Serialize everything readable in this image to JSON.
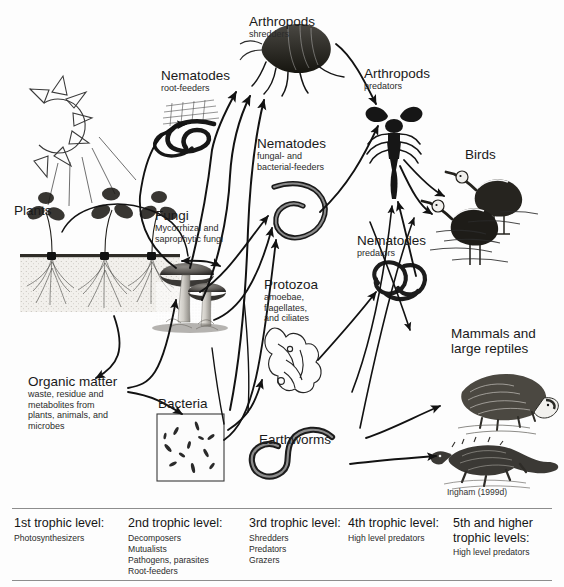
{
  "figure": {
    "credit": "Ingham (1999d)",
    "line_color": "#121212",
    "background": "#fdfdfd"
  },
  "nodes": [
    {
      "id": "sun",
      "icon": "sun-icon",
      "name": "",
      "sub": ""
    },
    {
      "id": "plants",
      "icon": "plants-icon",
      "name": "Plants",
      "sub": ""
    },
    {
      "id": "organic",
      "icon": "organic-matter-icon",
      "name": "Organic matter",
      "sub": "waste, residue and\nmetabolites from\nplants, animals, and\nmicrobes"
    },
    {
      "id": "fungi",
      "icon": "mushroom-icon",
      "name": "Fungi",
      "sub": "Mycorrhizal and\nsaprophytic fungi"
    },
    {
      "id": "bacteria",
      "icon": "bacteria-icon",
      "name": "Bacteria",
      "sub": ""
    },
    {
      "id": "nem-root",
      "icon": "nematode-coil-icon",
      "name": "Nematodes",
      "sub": "root-feeders"
    },
    {
      "id": "nem-fb",
      "icon": "nematode-worm-icon",
      "name": "Nematodes",
      "sub": "fungal- and\nbacterial-feeders"
    },
    {
      "id": "nem-pred",
      "icon": "nematode-knot-icon",
      "name": "Nematodes",
      "sub": "predators"
    },
    {
      "id": "protozoa",
      "icon": "amoeba-icon",
      "name": "Protozoa",
      "sub": "amoebae,\nflagellates,\nand ciliates"
    },
    {
      "id": "earthworms",
      "icon": "earthworm-icon",
      "name": "Earthworms",
      "sub": ""
    },
    {
      "id": "arth-shred",
      "icon": "flea-icon",
      "name": "Arthropods",
      "sub": "shredders"
    },
    {
      "id": "arth-pred",
      "icon": "scorpion-icon",
      "name": "Arthropods",
      "sub": "predators"
    },
    {
      "id": "birds",
      "icon": "birds-icon",
      "name": "Birds",
      "sub": ""
    },
    {
      "id": "mammals",
      "icon": "badger-icon",
      "name": "Mammals and\nlarge reptiles",
      "sub": ""
    },
    {
      "id": "reptile",
      "icon": "iguana-icon",
      "name": "",
      "sub": ""
    }
  ],
  "labels": {
    "arthropods_shredders": {
      "line1": "Arthropods",
      "line2": "shredders"
    },
    "arthropods_predators": {
      "line1": "Arthropods",
      "line2": "predators"
    },
    "nematodes_rootfeeders": {
      "line1": "Nematodes",
      "line2": "root-feeders"
    },
    "nematodes_fungalbact": {
      "line1": "Nematodes",
      "line2a": "fungal- and",
      "line2b": "bacterial-feeders"
    },
    "nematodes_predators": {
      "line1": "Nematodes",
      "line2": "predators"
    },
    "protozoa": {
      "line1": "Protozoa",
      "line2a": "amoebae,",
      "line2b": "flagellates,",
      "line2c": "and ciliates"
    },
    "fungi": {
      "line1": "Fungi",
      "line2a": "Mycorrhizal and",
      "line2b": "saprophytic fungi"
    },
    "plants": {
      "line1": "Plants"
    },
    "organic_matter": {
      "line1": "Organic matter",
      "line2a": "waste, residue and",
      "line2b": "metabolites from",
      "line2c": "plants, animals, and",
      "line2d": "microbes"
    },
    "bacteria": {
      "line1": "Bacteria"
    },
    "earthworms": {
      "line1": "Earthworms"
    },
    "birds": {
      "line1": "Birds"
    },
    "mammals": {
      "line1a": "Mammals and",
      "line1b": "large reptiles"
    }
  },
  "legend": {
    "columns": [
      {
        "head": "1st trophic level:",
        "items": [
          "Photosynthesizers"
        ]
      },
      {
        "head": "2nd trophic level:",
        "items": [
          "Decomposers",
          "Mutualists",
          "Pathogens, parasites",
          "Root-feeders"
        ]
      },
      {
        "head": "3rd trophic level:",
        "items": [
          "Shredders",
          "Predators",
          "Grazers"
        ]
      },
      {
        "head": "4th trophic level:",
        "items": [
          "High level predators"
        ]
      },
      {
        "head": "5th and higher",
        "head2": "trophic levels:",
        "items": [
          "High level predators"
        ]
      }
    ]
  }
}
